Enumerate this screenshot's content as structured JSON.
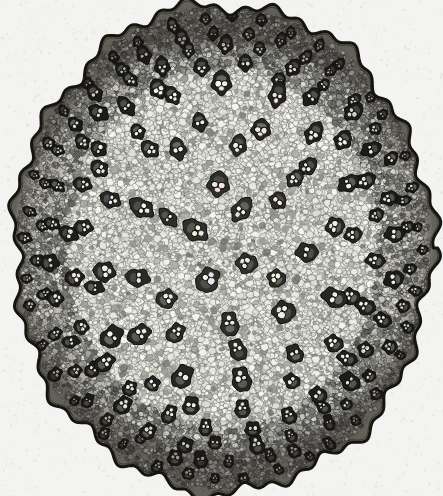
{
  "figure": {
    "domain_kind": "scientific-illustration",
    "title": "",
    "caption": "",
    "background_color": "#f3f3f1",
    "ink_color": "#111110",
    "paper_tone": "#efefed"
  },
  "canvas": {
    "width": 443,
    "height": 496
  },
  "section": {
    "name": "stem-cross-section",
    "center_x": 223,
    "center_y": 248,
    "radius_x": 209,
    "radius_y": 244,
    "outline_color": "#15140f",
    "outline_width": 3.0,
    "lobe_count": 46,
    "lobe_amplitude": 3.4,
    "ground_tissue_color": "#ded9ce"
  },
  "zones": [
    {
      "name": "epidermis",
      "label": "epidermis",
      "inner_fraction": 0.965,
      "outer_fraction": 1.0,
      "tone": "#1b1a16"
    },
    {
      "name": "hypodermal-sclerenchyma",
      "label": "hypodermis / sclerenchyma ring",
      "inner_fraction": 0.9,
      "outer_fraction": 0.965,
      "tone": "#3b3830"
    },
    {
      "name": "peripheral-bundle-zone",
      "label": "peripheral vascular bundle zone",
      "inner_fraction": 0.62,
      "outer_fraction": 0.965,
      "tone": "#6d6a60"
    },
    {
      "name": "central-ground-tissue",
      "label": "central parenchyma ground tissue",
      "inner_fraction": 0.0,
      "outer_fraction": 0.62,
      "tone": "#e6e2d8"
    }
  ],
  "cell_texture": {
    "name": "parenchyma-cells",
    "cell_count": 16000,
    "cell_min_radius": 1.7,
    "cell_max_radius": 4.6,
    "wall_color": "#6a665c",
    "wall_width": 0.55,
    "lumen_light": "#f3f1ea",
    "lumen_mid": "#ddd8cc",
    "lumen_dark": "#b4ae9f",
    "dark_cell_fraction": 0.16
  },
  "bundles": {
    "name": "vascular-bundles",
    "total_count": 178,
    "ring_layout": [
      {
        "ring": 1,
        "radius_fraction": 0.945,
        "count": 40,
        "size": 5.2,
        "darkness": 0.95,
        "jitter": 0.012
      },
      {
        "ring": 2,
        "radius_fraction": 0.885,
        "count": 36,
        "size": 6.2,
        "darkness": 0.92,
        "jitter": 0.016
      },
      {
        "ring": 3,
        "radius_fraction": 0.818,
        "count": 30,
        "size": 7.0,
        "darkness": 0.88,
        "jitter": 0.02
      },
      {
        "ring": 4,
        "radius_fraction": 0.742,
        "count": 24,
        "size": 7.8,
        "darkness": 0.84,
        "jitter": 0.024
      },
      {
        "ring": 5,
        "radius_fraction": 0.652,
        "count": 17,
        "size": 8.4,
        "darkness": 0.78,
        "jitter": 0.03
      },
      {
        "ring": 6,
        "radius_fraction": 0.545,
        "count": 12,
        "size": 8.8,
        "darkness": 0.72,
        "jitter": 0.035
      },
      {
        "ring": 7,
        "radius_fraction": 0.425,
        "count": 9,
        "size": 9.2,
        "darkness": 0.66,
        "jitter": 0.04
      },
      {
        "ring": 8,
        "radius_fraction": 0.295,
        "count": 6,
        "size": 9.4,
        "darkness": 0.62,
        "jitter": 0.05
      },
      {
        "ring": 9,
        "radius_fraction": 0.15,
        "count": 4,
        "size": 9.6,
        "darkness": 0.6,
        "jitter": 0.06
      }
    ],
    "sheath_color": "#1a1813",
    "phloem_color": "#4a463c",
    "xylem_lumen_color": "#f6f4ee",
    "xylem_vessel_count": 2,
    "lacuna_present": true
  },
  "scattered_dark_patches": {
    "name": "sclerenchyma-strands",
    "count": 240,
    "color": "#8a8679",
    "min_size": 1.6,
    "max_size": 4.2
  },
  "margins": {
    "left": 4,
    "right": 4,
    "top": 2,
    "bottom": 4
  }
}
